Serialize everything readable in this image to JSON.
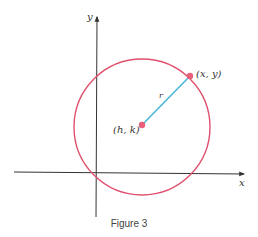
{
  "figure": {
    "caption": "Figure 3",
    "axes": {
      "x_label": "x",
      "y_label": "y"
    },
    "center_label": "(h, k)",
    "point_label": "(x, y)",
    "radius_label": "r",
    "colors": {
      "circle": "#e0506e",
      "radius": "#4ab8d8",
      "axes": "#333333",
      "points": "#e8607a"
    }
  }
}
